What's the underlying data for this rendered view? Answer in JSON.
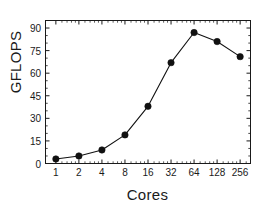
{
  "chart_data": {
    "type": "line",
    "title": "",
    "xlabel": "Cores",
    "ylabel": "GFLOPS",
    "x": [
      1,
      2,
      4,
      8,
      16,
      32,
      64,
      128,
      256
    ],
    "xtick_labels": [
      "1",
      "2",
      "4",
      "8",
      "16",
      "32",
      "64",
      "128",
      "256"
    ],
    "xscale": "log2",
    "values": [
      3,
      5,
      9,
      19,
      38,
      67,
      87,
      81,
      71
    ],
    "series": [
      {
        "name": "GFLOPS",
        "values": [
          3,
          5,
          9,
          19,
          38,
          67,
          87,
          81,
          71
        ],
        "marker": "filled-circle",
        "color": "#111111",
        "line_color": "#111111"
      }
    ],
    "ytick_labels": [
      "0",
      "15",
      "30",
      "45",
      "60",
      "75",
      "90"
    ],
    "yticks": [
      0,
      15,
      30,
      45,
      60,
      75,
      90
    ],
    "ylim": [
      0,
      95
    ],
    "xlim_index": [
      -0.45,
      8.45
    ],
    "grid": false,
    "legend": false,
    "minor_ticks": true,
    "tick_direction": "in",
    "frame": "box",
    "peak": {
      "x": 64,
      "y": 87
    }
  },
  "figure": {
    "background": "#ffffff",
    "axis_color": "#1a1a1a",
    "line_color": "#111111",
    "marker_color": "#111111"
  }
}
